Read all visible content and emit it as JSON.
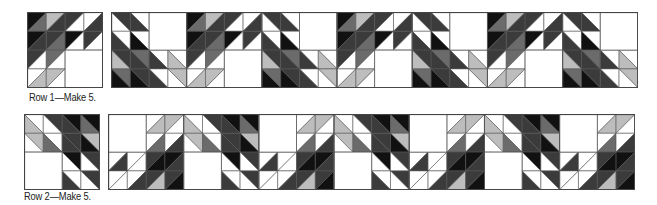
{
  "colors": {
    "K": "#111111",
    "D": "#3b3b3b",
    "M": "#6b6b6b",
    "L": "#bdbdbd",
    "W": "#ffffff",
    "line": "#555555"
  },
  "captions": {
    "row1": "Row 1—Make 5.",
    "row2": "Row 2—Make 5."
  },
  "blocks": {
    "A": {
      "cells": [
        [
          [
            "/",
            "K",
            "M"
          ],
          [
            "/",
            "L",
            "D"
          ],
          [
            "/",
            "D",
            "W"
          ],
          [
            "/",
            "W",
            "D"
          ]
        ],
        [
          [
            "/",
            "K",
            "D"
          ],
          [
            "/",
            "D",
            "M"
          ],
          [
            "/",
            "K",
            "W"
          ],
          [
            "/",
            "D",
            "W"
          ]
        ],
        [
          [
            "/",
            "D",
            "W"
          ],
          [
            "/",
            "M",
            "W"
          ],
          [
            "E"
          ],
          [
            "E"
          ]
        ],
        [
          [
            "/",
            "W",
            "L"
          ],
          [
            "/",
            "L",
            "W"
          ],
          [
            "E"
          ],
          [
            "E"
          ]
        ]
      ],
      "merged_white": [
        [
          2,
          2
        ]
      ]
    },
    "B": {
      "cells": [
        [
          [
            "\\",
            "D",
            "W"
          ],
          [
            "\\",
            "W",
            "D"
          ],
          [
            "E"
          ],
          [
            "E"
          ]
        ],
        [
          [
            "\\",
            "W",
            "D"
          ],
          [
            "\\",
            "W",
            "K"
          ],
          [
            "E"
          ],
          [
            "E"
          ]
        ],
        [
          [
            "\\",
            "D",
            "L"
          ],
          [
            "\\",
            "M",
            "D"
          ],
          [
            "\\",
            "W",
            "D"
          ],
          [
            "\\",
            "W",
            "L"
          ]
        ],
        [
          [
            "\\",
            "M",
            "K"
          ],
          [
            "\\",
            "D",
            "K"
          ],
          [
            "\\",
            "W",
            "D"
          ],
          [
            "\\",
            "L",
            "W"
          ]
        ]
      ],
      "merged_white": [
        [
          0,
          2
        ]
      ]
    },
    "C": {
      "cells": [
        [
          [
            "E"
          ],
          [
            "E"
          ],
          [
            "/",
            "W",
            "L"
          ],
          [
            "/",
            "L",
            "W"
          ]
        ],
        [
          [
            "E"
          ],
          [
            "E"
          ],
          [
            "/",
            "W",
            "M"
          ],
          [
            "/",
            "W",
            "D"
          ]
        ],
        [
          [
            "/",
            "W",
            "D"
          ],
          [
            "/",
            "W",
            "W"
          ],
          [
            "/",
            "D",
            "K"
          ],
          [
            "/",
            "K",
            "D"
          ]
        ],
        [
          [
            "/",
            "W",
            "W"
          ],
          [
            "/",
            "W",
            "D"
          ],
          [
            "/",
            "D",
            "L"
          ],
          [
            "/",
            "D",
            "K"
          ]
        ]
      ],
      "merged_white": [
        [
          0,
          0
        ]
      ]
    },
    "R2": {
      "cells": [
        [
          [
            "\\",
            "W",
            "L"
          ],
          [
            "\\",
            "D",
            "W"
          ],
          [
            "\\",
            "K",
            "D"
          ],
          [
            "\\",
            "K",
            "M"
          ]
        ],
        [
          [
            "\\",
            "L",
            "W"
          ],
          [
            "\\",
            "W",
            "M"
          ],
          [
            "\\",
            "D",
            "D"
          ],
          [
            "\\",
            "L",
            "K"
          ]
        ],
        [
          [
            "E"
          ],
          [
            "E"
          ],
          [
            "\\",
            "K",
            "W"
          ],
          [
            "\\",
            "D",
            "W"
          ]
        ],
        [
          [
            "E"
          ],
          [
            "E"
          ],
          [
            "\\",
            "W",
            "D"
          ],
          [
            "\\",
            "D",
            "W"
          ]
        ]
      ],
      "merged_white": [
        [
          2,
          0
        ]
      ]
    }
  },
  "rows": [
    {
      "name": "row1",
      "single_block": "A",
      "single_pos": [
        27,
        12
      ],
      "strip_blocks": [
        "B",
        "A",
        "B",
        "A",
        "B",
        "A",
        "B"
      ],
      "strip_pos": [
        111,
        12
      ],
      "caption_pos": [
        29,
        91
      ]
    },
    {
      "name": "row2",
      "single_block": "R2",
      "single_pos": [
        24,
        114
      ],
      "strip_blocks": [
        "C",
        "R2",
        "C",
        "R2",
        "C",
        "R2",
        "C"
      ],
      "strip_pos": [
        108,
        114
      ],
      "caption_pos": [
        24,
        190
      ]
    }
  ],
  "cell_size": 18.8
}
